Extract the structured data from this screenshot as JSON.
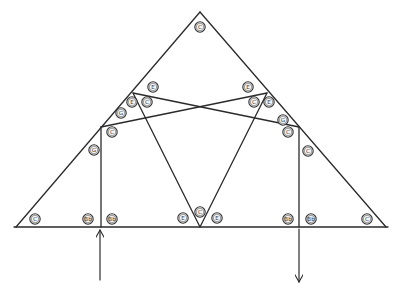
{
  "diagram": {
    "type": "truss",
    "stroke_color": "#2a2a2a",
    "members": [
      {
        "id": "left-rafter",
        "x1": 16,
        "y1": 227,
        "x2": 200,
        "y2": 12
      },
      {
        "id": "right-rafter",
        "x1": 200,
        "y1": 12,
        "x2": 386,
        "y2": 227
      },
      {
        "id": "bottom-chord",
        "x1": 14,
        "y1": 227,
        "x2": 388,
        "y2": 227
      },
      {
        "id": "cross-left-to-right",
        "x1": 101,
        "y1": 127,
        "x2": 267,
        "y2": 93
      },
      {
        "id": "cross-right-to-left",
        "x1": 133,
        "y1": 93,
        "x2": 299,
        "y2": 127
      },
      {
        "id": "web-left-diagonal",
        "x1": 133,
        "y1": 93,
        "x2": 200,
        "y2": 227
      },
      {
        "id": "web-right-diagonal",
        "x1": 267,
        "y1": 93,
        "x2": 200,
        "y2": 227
      },
      {
        "id": "left-post",
        "x1": 101,
        "y1": 127,
        "x2": 101,
        "y2": 227
      },
      {
        "id": "right-post",
        "x1": 299,
        "y1": 127,
        "x2": 299,
        "y2": 227
      }
    ],
    "arrows": [
      {
        "id": "left-support-reaction-up",
        "x": 100,
        "y_tail": 280,
        "y_head": 230,
        "direction": "up"
      },
      {
        "id": "right-load-down",
        "x": 299,
        "y_tail": 229,
        "y_head": 282,
        "direction": "down"
      }
    ],
    "labels": [
      {
        "text": "C",
        "x": 200,
        "y": 27
      },
      {
        "text": "E",
        "x": 153,
        "y": 87
      },
      {
        "text": "E",
        "x": 248,
        "y": 87
      },
      {
        "text": "E",
        "x": 132,
        "y": 102
      },
      {
        "text": "C",
        "x": 147,
        "y": 102
      },
      {
        "text": "C",
        "x": 254,
        "y": 102
      },
      {
        "text": "E",
        "x": 269,
        "y": 102
      },
      {
        "text": "G",
        "x": 121,
        "y": 113
      },
      {
        "text": "G",
        "x": 283,
        "y": 120
      },
      {
        "text": "C",
        "x": 112,
        "y": 132
      },
      {
        "text": "C",
        "x": 288,
        "y": 132
      },
      {
        "text": "G",
        "x": 94,
        "y": 150
      },
      {
        "text": "C",
        "x": 308,
        "y": 151
      },
      {
        "text": "C",
        "x": 35,
        "y": 219
      },
      {
        "text": "Bb",
        "x": 88,
        "y": 219
      },
      {
        "text": "Bb",
        "x": 112,
        "y": 219
      },
      {
        "text": "E",
        "x": 183,
        "y": 218
      },
      {
        "text": "C",
        "x": 200,
        "y": 212
      },
      {
        "text": "E",
        "x": 217,
        "y": 218
      },
      {
        "text": "Bb",
        "x": 288,
        "y": 219
      },
      {
        "text": "Bb",
        "x": 311,
        "y": 219
      },
      {
        "text": "C",
        "x": 367,
        "y": 219
      }
    ]
  }
}
